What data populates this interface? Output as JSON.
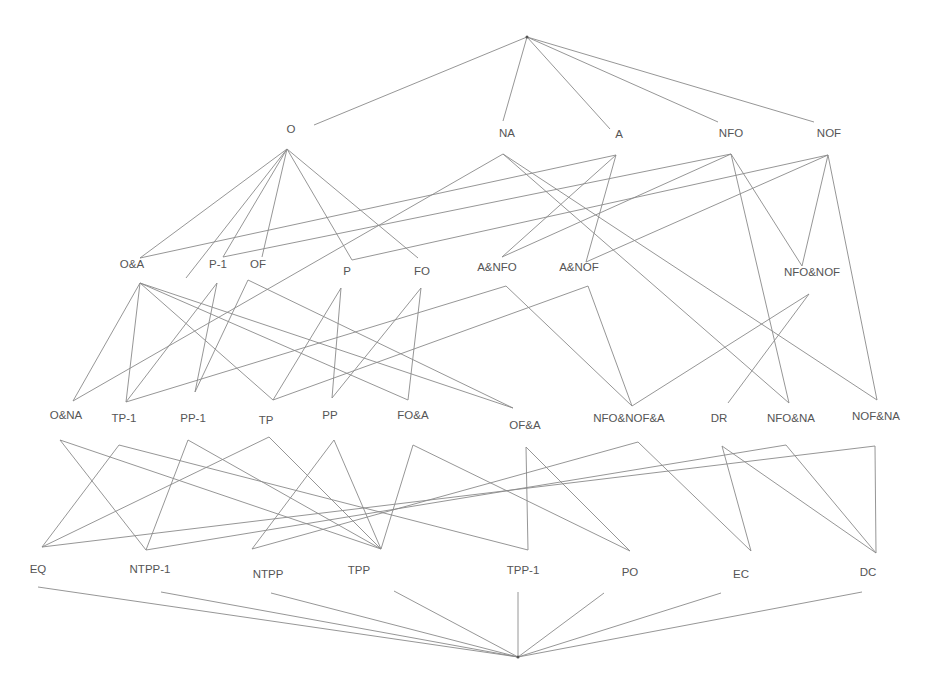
{
  "diagram": {
    "type": "lattice",
    "top": {
      "id": "top",
      "x": 527,
      "y": 37
    },
    "bottom": {
      "id": "bottom",
      "x": 518,
      "y": 657
    },
    "nodes": [
      {
        "id": "O",
        "label": "O",
        "lx": 291,
        "ly": 130,
        "ax": 287,
        "ay": 149
      },
      {
        "id": "NA",
        "label": "NA",
        "lx": 507,
        "ly": 134,
        "ax": 503,
        "ay": 154
      },
      {
        "id": "A",
        "label": "A",
        "lx": 619,
        "ly": 135,
        "ax": 616,
        "ay": 155
      },
      {
        "id": "NFO",
        "label": "NFO",
        "lx": 731,
        "ly": 134,
        "ax": 731,
        "ay": 154
      },
      {
        "id": "NOF",
        "label": "NOF",
        "lx": 829,
        "ly": 134,
        "ax": 828,
        "ay": 155
      },
      {
        "id": "OA",
        "label": "O&A",
        "lx": 132,
        "ly": 265,
        "ax": 140,
        "ay": 283
      },
      {
        "id": "P1",
        "label": "P-1",
        "lx": 218,
        "ly": 265,
        "ax": 217,
        "ay": 283
      },
      {
        "id": "OF",
        "label": "OF",
        "lx": 258,
        "ly": 265,
        "ax": 248,
        "ay": 280
      },
      {
        "id": "P",
        "label": "P",
        "lx": 347,
        "ly": 272,
        "ax": 341,
        "ay": 288
      },
      {
        "id": "FO",
        "label": "FO",
        "lx": 422,
        "ly": 272,
        "ax": 421,
        "ay": 288
      },
      {
        "id": "ANFO",
        "label": "A&NFO",
        "lx": 497,
        "ly": 268,
        "ax": 506,
        "ay": 286
      },
      {
        "id": "ANOF",
        "label": "A&NOF",
        "lx": 579,
        "ly": 268,
        "ax": 588,
        "ay": 286
      },
      {
        "id": "NFONOF",
        "label": "NFO&NOF",
        "lx": 812,
        "ly": 273,
        "ax": 809,
        "ay": 294
      },
      {
        "id": "ONA",
        "label": "O&NA",
        "lx": 66,
        "ly": 416,
        "ax": 73,
        "ay": 401
      },
      {
        "id": "TP1",
        "label": "TP-1",
        "lx": 124,
        "ly": 419,
        "ax": 126,
        "ay": 402
      },
      {
        "id": "PP1",
        "label": "PP-1",
        "lx": 193,
        "ly": 419,
        "ax": 195,
        "ay": 392
      },
      {
        "id": "TP",
        "label": "TP",
        "lx": 266,
        "ly": 421,
        "ax": 273,
        "ay": 400
      },
      {
        "id": "PP",
        "label": "PP",
        "lx": 330,
        "ly": 416,
        "ax": 332,
        "ay": 398
      },
      {
        "id": "FOA",
        "label": "FO&A",
        "lx": 413,
        "ly": 416,
        "ax": 408,
        "ay": 400
      },
      {
        "id": "OFA",
        "label": "OF&A",
        "lx": 525,
        "ly": 426,
        "ax": 520,
        "ay": 408
      },
      {
        "id": "NFONOFA",
        "label": "NFO&NOF&A",
        "lx": 629,
        "ly": 419,
        "ax": 632,
        "ay": 406
      },
      {
        "id": "DR",
        "label": "DR",
        "lx": 719,
        "ly": 419,
        "ax": 728,
        "ay": 403
      },
      {
        "id": "NFONA",
        "label": "NFO&NA",
        "lx": 791,
        "ly": 419,
        "ax": 789,
        "ay": 403
      },
      {
        "id": "NOFNA",
        "label": "NOF&NA",
        "lx": 876,
        "ly": 417,
        "ax": 877,
        "ay": 400
      },
      {
        "id": "EQ",
        "label": "EQ",
        "lx": 38,
        "ly": 570,
        "ax": 42,
        "ay": 547
      },
      {
        "id": "NTPP1",
        "label": "NTPP-1",
        "lx": 150,
        "ly": 570,
        "ax": 146,
        "ay": 550
      },
      {
        "id": "NTPP",
        "label": "NTPP",
        "lx": 268,
        "ly": 575,
        "ax": 252,
        "ay": 549
      },
      {
        "id": "TPP",
        "label": "TPP",
        "lx": 359,
        "ly": 571,
        "ax": 381,
        "ay": 549
      },
      {
        "id": "TPP1",
        "label": "TPP-1",
        "lx": 523,
        "ly": 571,
        "ax": 528,
        "ay": 550
      },
      {
        "id": "PO",
        "label": "PO",
        "lx": 630,
        "ly": 573,
        "ax": 630,
        "ay": 551
      },
      {
        "id": "EC",
        "label": "EC",
        "lx": 741,
        "ly": 575,
        "ax": 751,
        "ay": 551
      },
      {
        "id": "DC",
        "label": "DC",
        "lx": 868,
        "ly": 573,
        "ax": 876,
        "ay": 553
      }
    ],
    "edges": [
      [
        "top",
        314,
        125,
        527,
        37
      ],
      [
        "top",
        503,
        121,
        527,
        37
      ],
      [
        "top",
        610,
        129,
        527,
        37
      ],
      [
        "top",
        718,
        122,
        527,
        37
      ],
      [
        "top",
        814,
        122,
        527,
        37
      ],
      [
        "O-OA",
        287,
        149,
        140,
        258
      ],
      [
        "O-TP1",
        287,
        149,
        186,
        278
      ],
      [
        "O-P1",
        287,
        149,
        223,
        257
      ],
      [
        "O-OF",
        287,
        149,
        262,
        257
      ],
      [
        "O-P",
        287,
        149,
        352,
        260
      ],
      [
        "O-FO",
        287,
        149,
        418,
        258
      ],
      [
        "NA-ONA",
        503,
        154,
        73,
        401
      ],
      [
        "NA-NFONA",
        503,
        154,
        789,
        403
      ],
      [
        "NA-NOFNA",
        503,
        154,
        877,
        400
      ],
      [
        "A-OA",
        616,
        155,
        140,
        258
      ],
      [
        "A-ANFO",
        616,
        155,
        502,
        257
      ],
      [
        "A-ANOF",
        616,
        155,
        586,
        262
      ],
      [
        "NFO-P1",
        731,
        154,
        223,
        257
      ],
      [
        "NFO-ANFO",
        731,
        154,
        502,
        257
      ],
      [
        "NFO-NFONOF",
        731,
        154,
        802,
        266
      ],
      [
        "NFO-NFONA",
        731,
        154,
        789,
        403
      ],
      [
        "NOF-P",
        828,
        155,
        352,
        260
      ],
      [
        "NOF-ANOF",
        828,
        155,
        586,
        262
      ],
      [
        "NOF-NFONOF",
        828,
        155,
        802,
        266
      ],
      [
        "NOF-NOFNA",
        828,
        155,
        877,
        400
      ],
      [
        "OA-ONA",
        140,
        283,
        73,
        401
      ],
      [
        "OA-TP1",
        140,
        283,
        126,
        402
      ],
      [
        "OA-FOA",
        140,
        283,
        408,
        400
      ],
      [
        "OA-OFA",
        140,
        283,
        513,
        408
      ],
      [
        "OA-TP",
        140,
        283,
        273,
        400
      ],
      [
        "P1-TP1",
        217,
        283,
        126,
        402
      ],
      [
        "P1-PP1",
        217,
        283,
        195,
        392
      ],
      [
        "OF-PP1",
        248,
        280,
        195,
        392
      ],
      [
        "OF-OFA",
        248,
        280,
        513,
        408
      ],
      [
        "P-TP",
        341,
        288,
        273,
        400
      ],
      [
        "P-PP",
        341,
        288,
        332,
        398
      ],
      [
        "FO-PP",
        421,
        288,
        332,
        398
      ],
      [
        "FO-FOA",
        421,
        288,
        408,
        400
      ],
      [
        "ANFO-TP1",
        506,
        286,
        126,
        402
      ],
      [
        "ANFO-NFONOFA",
        506,
        286,
        632,
        406
      ],
      [
        "ANOF-TP",
        588,
        286,
        273,
        400
      ],
      [
        "ANOF-NFONOFA",
        588,
        286,
        632,
        406
      ],
      [
        "NFONOF-NFONOFA",
        809,
        294,
        632,
        406
      ],
      [
        "NFONOF-DR",
        809,
        294,
        728,
        403
      ],
      [
        "ONA-NTPP1",
        60,
        440,
        146,
        550
      ],
      [
        "ONA-TPP",
        60,
        440,
        381,
        549
      ],
      [
        "TP1-EQ",
        119,
        445,
        42,
        547
      ],
      [
        "TP1-TPP1",
        119,
        445,
        528,
        550
      ],
      [
        "PP1-NTPP1",
        188,
        440,
        146,
        550
      ],
      [
        "PP1-TPP1",
        188,
        440,
        381,
        549
      ],
      [
        "TP-EQ",
        269,
        437,
        42,
        547
      ],
      [
        "TP-TPP",
        269,
        437,
        381,
        549
      ],
      [
        "PP-NTPP",
        334,
        440,
        252,
        549
      ],
      [
        "PP-TPP",
        334,
        440,
        381,
        549
      ],
      [
        "FOA-TPP",
        413,
        445,
        381,
        549
      ],
      [
        "FOA-PO",
        413,
        445,
        630,
        551
      ],
      [
        "OFA-TPP1",
        526,
        447,
        528,
        550
      ],
      [
        "OFA-PO",
        526,
        447,
        630,
        551
      ],
      [
        "NFONOFA-NTPP",
        638,
        442,
        252,
        549
      ],
      [
        "NFONOFA-EC",
        638,
        442,
        751,
        551
      ],
      [
        "DR-EC",
        722,
        446,
        751,
        551
      ],
      [
        "DR-DC",
        722,
        446,
        876,
        553
      ],
      [
        "NFONA-NTPP1",
        786,
        445,
        146,
        550
      ],
      [
        "NFONA-DC",
        786,
        445,
        876,
        553
      ],
      [
        "NOFNA-EQ",
        875,
        446,
        42,
        547
      ],
      [
        "NOFNA-DC",
        875,
        446,
        876,
        553
      ],
      [
        "EQ-bot",
        38,
        587,
        518,
        657
      ],
      [
        "NTPP1-bot",
        161,
        592,
        518,
        657
      ],
      [
        "NTPP-bot",
        271,
        593,
        518,
        657
      ],
      [
        "TPP-bot",
        394,
        591,
        518,
        657
      ],
      [
        "TPP1-bot",
        518,
        592,
        518,
        657
      ],
      [
        "PO-bot",
        604,
        593,
        518,
        657
      ],
      [
        "EC-bot",
        721,
        593,
        518,
        657
      ],
      [
        "DC-bot",
        862,
        592,
        518,
        657
      ]
    ]
  },
  "colors": {
    "line": "#8a8a8a",
    "text": "#555555",
    "background": "#ffffff"
  }
}
